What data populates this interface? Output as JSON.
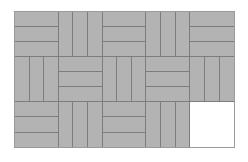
{
  "figure": {
    "width_px": 248,
    "height_px": 162
  },
  "colors": {
    "tile_fill": "#b3b3b3",
    "plank_line": "#7d7d7d",
    "outer_border": "#9a9a9a",
    "empty_fill": "#ffffff",
    "page_background": "#ffffff"
  },
  "grid": {
    "columns": 5,
    "rows": 3,
    "planks_per_block": 3,
    "blocks": [
      [
        {
          "orientation": "horizontal",
          "filled": true
        },
        {
          "orientation": "vertical",
          "filled": true
        },
        {
          "orientation": "horizontal",
          "filled": true
        },
        {
          "orientation": "vertical",
          "filled": true
        },
        {
          "orientation": "horizontal",
          "filled": true
        }
      ],
      [
        {
          "orientation": "vertical",
          "filled": true
        },
        {
          "orientation": "horizontal",
          "filled": true
        },
        {
          "orientation": "vertical",
          "filled": true
        },
        {
          "orientation": "horizontal",
          "filled": true
        },
        {
          "orientation": "vertical",
          "filled": true
        }
      ],
      [
        {
          "orientation": "horizontal",
          "filled": true
        },
        {
          "orientation": "vertical",
          "filled": true
        },
        {
          "orientation": "horizontal",
          "filled": true
        },
        {
          "orientation": "vertical",
          "filled": true
        },
        {
          "orientation": "empty",
          "filled": false
        }
      ]
    ]
  }
}
